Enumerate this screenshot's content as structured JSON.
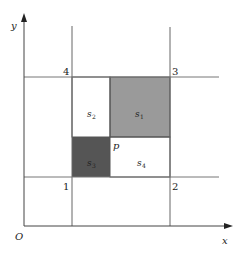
{
  "diagram": {
    "axes": {
      "x_label": "x",
      "y_label": "y",
      "origin_label": "O"
    },
    "corners": [
      {
        "id": "1",
        "label": "1"
      },
      {
        "id": "2",
        "label": "2"
      },
      {
        "id": "3",
        "label": "3"
      },
      {
        "id": "4",
        "label": "4"
      }
    ],
    "point": {
      "label": "p"
    },
    "squares": [
      {
        "id": "s1",
        "label": "s",
        "sub": "1",
        "fill": "#9a9a9a"
      },
      {
        "id": "s2",
        "label": "s",
        "sub": "2",
        "fill": "#ffffff"
      },
      {
        "id": "s3",
        "label": "s",
        "sub": "3",
        "fill": "#555555"
      },
      {
        "id": "s4",
        "label": "s",
        "sub": "4",
        "fill": "#ffffff"
      }
    ],
    "colors": {
      "line": "#666666",
      "axis": "#444444"
    }
  }
}
